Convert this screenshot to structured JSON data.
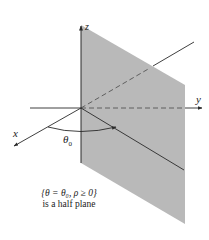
{
  "figure": {
    "axes": {
      "x_label": "x",
      "y_label": "y",
      "z_label": "z"
    },
    "angle_label": "θ",
    "angle_subscript": "0",
    "caption": {
      "line1": "{θ = θ₀, ρ ≥ 0}",
      "line2": "is a half plane"
    },
    "colors": {
      "plane_fill": "#b9b9b9",
      "line": "#2a2a2a",
      "background": "#ffffff"
    }
  }
}
